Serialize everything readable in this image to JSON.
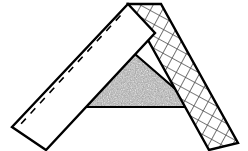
{
  "figure": {
    "title": "Two hatched strips meeting at an apex over a stippled triangle",
    "type": "geometric-line-drawing",
    "canvas": {
      "width": 248,
      "height": 151,
      "background": "#ffffff"
    },
    "colors": {
      "outline": "#000000",
      "plain_fill": "#ffffff",
      "stipple_dark": "#4d4d4d",
      "stipple_light": "#d9d9d9",
      "stipple_average": "#a0a0a0",
      "crosshatch_line": "#4a4a4a",
      "crosshatch_background": "#ffffff",
      "dash_line": "#000000"
    },
    "shapes": [
      {
        "id": "left-arm",
        "label": "Left strip (plain, dashed center line)",
        "fill_style": "plain-white",
        "outline_width": 2.4,
        "points": "128,4 155,33 46,150 12,127",
        "dash": {
          "from_x": 120.5,
          "from_y": 15.5,
          "to_x": 20.0,
          "to_y": 125.0,
          "dash_pattern": "7 7",
          "width": 1.6
        }
      },
      {
        "id": "right-arm",
        "label": "Right strip (cross-hatched)",
        "fill_style": "crosshatch",
        "outline_width": 2.4,
        "points": "128,4 161,4 238,143 209,150"
      },
      {
        "id": "center-triangle",
        "label": "Center triangle (stippled)",
        "fill_style": "stipple",
        "outline_width": 2.2,
        "points": "128,48 196,107 60,107"
      }
    ],
    "patterns": {
      "crosshatch": {
        "cell_px": 10.5,
        "line_width": 1.5,
        "orientation_deg": 28.5
      },
      "stipple": {
        "dot_density": "high",
        "grain_px": 1
      }
    }
  }
}
